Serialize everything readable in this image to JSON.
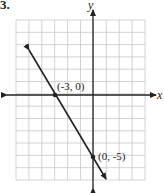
{
  "problem_number": "3.",
  "chart_data": {
    "type": "line",
    "title": "",
    "xlabel": "x",
    "ylabel": "y",
    "xlim": [
      -6,
      4
    ],
    "ylim": [
      -7,
      6
    ],
    "grid": true,
    "grid_step": 1,
    "series": [
      {
        "name": "line",
        "equation": "y = -5/3 x - 5",
        "slope": -1.6667,
        "intercept": -5,
        "points": [
          {
            "x": -3,
            "y": 0,
            "label": "(-3, 0)"
          },
          {
            "x": 0,
            "y": -5,
            "label": "(0, -5)"
          }
        ]
      }
    ],
    "annotations": [
      "(-3, 0)",
      "(0, -5)"
    ]
  },
  "labels": {
    "x_axis": "x",
    "y_axis": "y",
    "point1": "(-3, 0)",
    "point2": "(0, -5)"
  },
  "colors": {
    "grid": "#c8c8c8",
    "axis": "#222222",
    "line": "#222222"
  }
}
